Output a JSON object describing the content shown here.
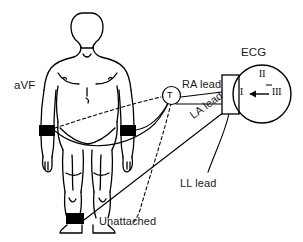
{
  "diagram": {
    "title_label": "ECG",
    "subject_label": "aVF",
    "leads": [
      {
        "id": "ra",
        "label": "RA lead"
      },
      {
        "id": "la",
        "label": "LA lead"
      },
      {
        "id": "ll",
        "label": "LL lead"
      }
    ],
    "connector": {
      "junction_label": "T",
      "unattached_label": "Unattached"
    },
    "monitor": {
      "device_label": "ECG",
      "vector_labels": {
        "top": "II",
        "left": "I",
        "right": "III"
      },
      "arrow_direction": "left"
    },
    "colors": {
      "background": "#ffffff",
      "ink": "#000000",
      "electrode": "#000000",
      "text": "#1a1a1a"
    },
    "electrodes": [
      {
        "id": "right-wrist",
        "site": "right wrist"
      },
      {
        "id": "left-wrist",
        "site": "left wrist"
      },
      {
        "id": "left-ankle",
        "site": "left ankle"
      }
    ]
  }
}
